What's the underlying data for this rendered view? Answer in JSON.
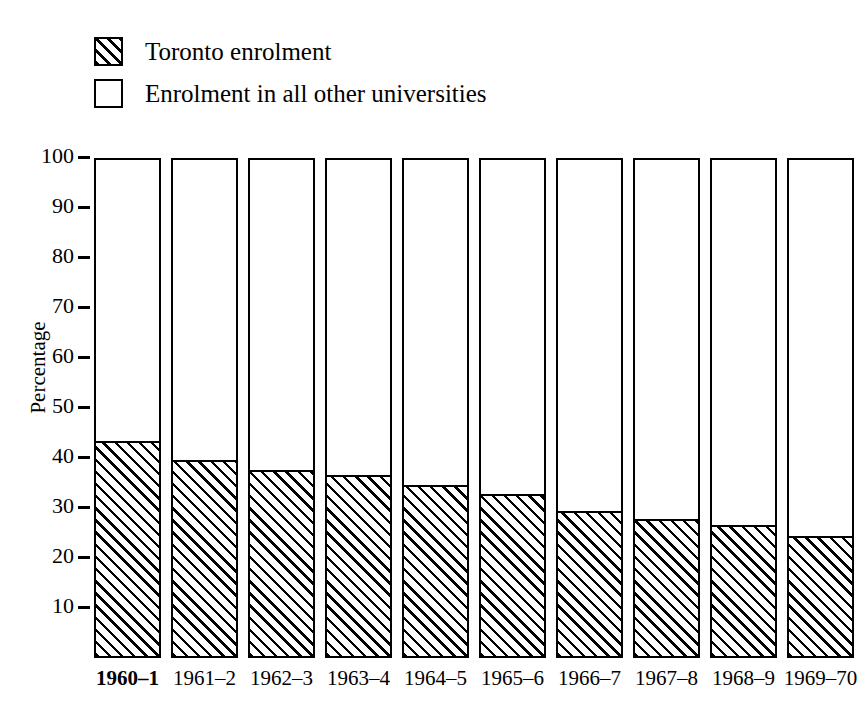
{
  "chart_data": {
    "type": "bar",
    "title": "",
    "subtitle": "",
    "xlabel": "",
    "ylabel": "Percentage",
    "ylim": [
      0,
      100
    ],
    "yticks": [
      10,
      20,
      30,
      40,
      50,
      60,
      70,
      80,
      90,
      100
    ],
    "ytick_labels": [
      "10",
      "20",
      "30",
      "40",
      "50",
      "60",
      "70",
      "80",
      "90",
      "100"
    ],
    "grid": false,
    "stacked": true,
    "stack_total": 100,
    "legend_position": "top-left",
    "categories": [
      "1960–1",
      "1961–2",
      "1962–3",
      "1963–4",
      "1964–5",
      "1965–6",
      "1966–7",
      "1967–8",
      "1968–9",
      "1969–70"
    ],
    "emphasized_categories": [
      "1960–1"
    ],
    "series": [
      {
        "name": "Toronto enrolment",
        "pattern": "diagonal-hatch",
        "values": [
          43.0,
          39.2,
          37.2,
          36.2,
          34.2,
          32.4,
          29.0,
          27.4,
          26.2,
          24.0
        ]
      },
      {
        "name": "Enrolment in all other universities",
        "pattern": "blank",
        "values": [
          57.0,
          60.8,
          62.8,
          63.8,
          65.8,
          67.6,
          71.0,
          72.6,
          73.8,
          76.0
        ]
      }
    ]
  },
  "legend": {
    "items": [
      {
        "label": "Toronto enrolment",
        "swatch": "hatched"
      },
      {
        "label": "Enrolment in all other universities",
        "swatch": "plain"
      }
    ]
  },
  "axis": {
    "y_label": "Percentage"
  }
}
